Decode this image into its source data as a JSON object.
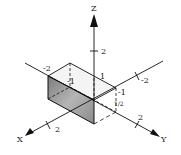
{
  "diagram": {
    "type": "3d-coordinate-axes-with-box",
    "axes": {
      "z": {
        "label": "Z",
        "tick_labels": [
          "2",
          "1"
        ]
      },
      "y": {
        "label": "Y",
        "tick_labels": [
          "-2",
          "2",
          "1"
        ]
      },
      "x": {
        "label": "X",
        "tick_labels": [
          "-2",
          "-1",
          "2",
          "-1"
        ]
      }
    },
    "labels": {
      "z_axis": "Z",
      "x_axis": "X",
      "y_axis": "Y",
      "z_tick_2": "2",
      "z_tick_1": "1",
      "y_neg2": "-2",
      "x_neg1_back": "-1",
      "x_neg2": "-2",
      "x_neg1": "-1",
      "y_half": "1/2",
      "y_2": "2",
      "x_2": "2"
    },
    "colors": {
      "line": "#111111",
      "shade": "#9a9a9a",
      "top_face": "#f2f2f2"
    }
  }
}
